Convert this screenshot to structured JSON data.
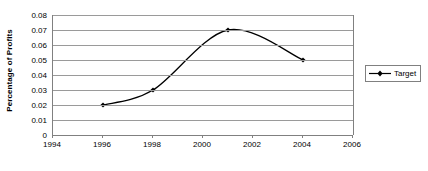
{
  "chart_data": {
    "type": "line",
    "title": "",
    "xlabel": "",
    "ylabel": "Percentage of Profits",
    "xlim": [
      1994,
      2006
    ],
    "ylim": [
      0,
      0.08
    ],
    "grid": true,
    "legend_position": "right",
    "x_ticks": [
      1994,
      1996,
      1998,
      2000,
      2002,
      2004,
      2006
    ],
    "x_tick_labels": [
      "1994",
      "1996",
      "1998",
      "2000",
      "2002",
      "2004",
      "2006"
    ],
    "y_ticks": [
      0,
      0.01,
      0.02,
      0.03,
      0.04,
      0.05,
      0.06,
      0.07,
      0.08
    ],
    "y_tick_labels": [
      "0",
      "0.01",
      "0.02",
      "0.03",
      "0.04",
      "0.05",
      "0.06",
      "0.07",
      "0.08"
    ],
    "series": [
      {
        "name": "Target",
        "color": "#000000",
        "marker": "diamond",
        "smooth": true,
        "x": [
          1996,
          1998,
          2001,
          2004
        ],
        "y": [
          0.02,
          0.03,
          0.07,
          0.05
        ],
        "points": [
          {
            "x": 1996,
            "y": 0.02
          },
          {
            "x": 1998,
            "y": 0.03
          },
          {
            "x": 2001,
            "y": 0.07
          },
          {
            "x": 2004,
            "y": 0.05
          }
        ]
      }
    ]
  },
  "legend": {
    "entries": [
      {
        "label": "Target"
      }
    ]
  },
  "colors": {
    "series_line": "#000000",
    "gridline": "#9a9a9a",
    "axis": "#808080",
    "text": "#000000",
    "background": "#ffffff"
  }
}
